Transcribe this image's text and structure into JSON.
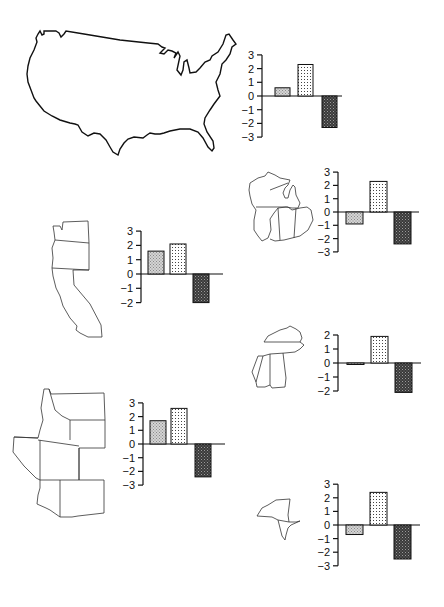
{
  "colors": {
    "line": "#111111",
    "bar1_fill": "#c8c8c8",
    "bar2_fill": "#ffffff",
    "bar2_dots": "#555555",
    "bar3_fill": "#444444",
    "background": "#ffffff"
  },
  "chart_data": [
    {
      "type": "bar",
      "region": "United States",
      "categories": [
        "bar1",
        "bar2",
        "bar3"
      ],
      "values": [
        0.6,
        2.3,
        -2.3
      ],
      "yticks": [
        3,
        2,
        1,
        0,
        -1,
        -2,
        -3
      ],
      "ylim": [
        -3,
        3
      ],
      "title": "",
      "xlabel": "",
      "ylabel": ""
    },
    {
      "type": "bar",
      "region": "Great Lakes / Midwest",
      "categories": [
        "bar1",
        "bar2",
        "bar3"
      ],
      "values": [
        -0.9,
        2.3,
        -2.4
      ],
      "yticks": [
        3,
        2,
        1,
        0,
        -1,
        -2,
        -3
      ],
      "ylim": [
        -3,
        3
      ],
      "title": "",
      "xlabel": "",
      "ylabel": ""
    },
    {
      "type": "bar",
      "region": "Pacific Coast",
      "categories": [
        "bar1",
        "bar2",
        "bar3"
      ],
      "values": [
        1.6,
        2.1,
        -2.0
      ],
      "yticks": [
        3,
        2,
        1,
        0,
        -1,
        -2
      ],
      "ylim": [
        -2,
        3
      ],
      "title": "",
      "xlabel": "",
      "ylabel": ""
    },
    {
      "type": "bar",
      "region": "Southeast",
      "categories": [
        "bar1",
        "bar2",
        "bar3"
      ],
      "values": [
        -0.1,
        1.9,
        -2.1
      ],
      "yticks": [
        2,
        1,
        0,
        -1,
        -2
      ],
      "ylim": [
        -2,
        2
      ],
      "title": "",
      "xlabel": "",
      "ylabel": ""
    },
    {
      "type": "bar",
      "region": "Mountain West",
      "categories": [
        "bar1",
        "bar2",
        "bar3"
      ],
      "values": [
        1.7,
        2.6,
        -2.4
      ],
      "yticks": [
        3,
        2,
        1,
        0,
        -1,
        -2,
        -3
      ],
      "ylim": [
        -3,
        3
      ],
      "title": "",
      "xlabel": "",
      "ylabel": ""
    },
    {
      "type": "bar",
      "region": "New York / Northeast",
      "categories": [
        "bar1",
        "bar2",
        "bar3"
      ],
      "values": [
        -0.7,
        2.4,
        -2.5
      ],
      "yticks": [
        3,
        2,
        1,
        0,
        -1,
        -2,
        -3
      ],
      "ylim": [
        -3,
        3
      ],
      "title": "",
      "xlabel": "",
      "ylabel": ""
    }
  ],
  "layout": [
    {
      "axisX": 262,
      "zeroY": 96,
      "unit": 13.7,
      "barW": 15,
      "bars": [
        275,
        298,
        322
      ],
      "baseEnd": 342
    },
    {
      "axisX": 338,
      "zeroY": 212,
      "unit": 13.3,
      "barW": 17,
      "bars": [
        346,
        370,
        394
      ],
      "baseEnd": 419
    },
    {
      "axisX": 141,
      "zeroY": 274,
      "unit": 14.3,
      "barW": 16,
      "bars": [
        148,
        170,
        193
      ],
      "baseEnd": 223
    },
    {
      "axisX": 338,
      "zeroY": 363,
      "unit": 14.0,
      "barW": 17,
      "bars": [
        347,
        371,
        395
      ],
      "baseEnd": 421
    },
    {
      "axisX": 143,
      "zeroY": 444,
      "unit": 13.7,
      "barW": 16,
      "bars": [
        150,
        171,
        195
      ],
      "baseEnd": 225
    },
    {
      "axisX": 338,
      "zeroY": 525,
      "unit": 13.6,
      "barW": 17,
      "bars": [
        346,
        370,
        394
      ],
      "baseEnd": 420
    }
  ]
}
